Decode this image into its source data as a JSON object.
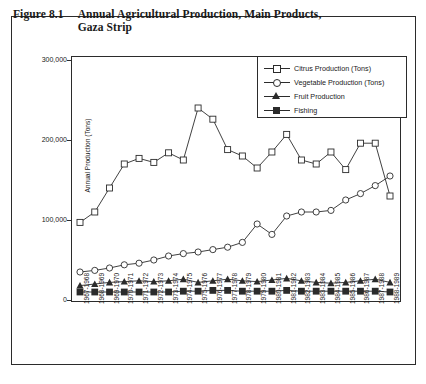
{
  "figure": {
    "number": "Figure 8.1",
    "title": "Annual Agricultural Production, Main Products, Gaza Strip"
  },
  "colors": {
    "ink": "#2b2b2b",
    "background": "#ffffff"
  },
  "chart_data": {
    "type": "line",
    "title": "Annual Agricultural Production, Main Products, Gaza Strip",
    "xlabel": "",
    "ylabel": "Annual Production (Tons)",
    "ylim": [
      0,
      300000
    ],
    "yticks": [
      0,
      100000,
      200000,
      300000
    ],
    "ytick_labels": [
      "0",
      "100,000",
      "200,000",
      "300,000"
    ],
    "grid": false,
    "legend_position": "top-right",
    "categories": [
      "1967-1968",
      "1968-1969",
      "1969-1970",
      "1970-1971",
      "1971-1972",
      "1972-1973",
      "1973-1974",
      "1974-1975",
      "1975-1976",
      "1976-1977",
      "1977-1978",
      "1978-1979",
      "1979-1980",
      "1980-1981",
      "1981-1982",
      "1982-1983",
      "1983-1984",
      "1984-1985",
      "1985-1986",
      "1986-1987",
      "1987-1988",
      "1988-1989"
    ],
    "series": [
      {
        "name": "Citrus Production (Tons)",
        "marker": "square-open",
        "values": [
          97000,
          110000,
          140000,
          170000,
          177000,
          172000,
          184000,
          175000,
          240000,
          226000,
          188000,
          180000,
          165000,
          185000,
          207000,
          175000,
          170000,
          185000,
          163000,
          196000,
          196000,
          130000
        ]
      },
      {
        "name": "Vegetable Production (Tons)",
        "marker": "circle-open",
        "values": [
          35000,
          37000,
          40000,
          44000,
          46000,
          50000,
          55000,
          58000,
          60000,
          63000,
          66000,
          72000,
          95000,
          82000,
          105000,
          110000,
          110000,
          112000,
          125000,
          133000,
          143000,
          155000
        ]
      },
      {
        "name": "Fruit Production",
        "marker": "triangle-filled",
        "values": [
          18000,
          20000,
          22000,
          23000,
          24000,
          23000,
          24000,
          26000,
          22000,
          24000,
          26000,
          24000,
          23000,
          25000,
          27000,
          24000,
          22000,
          21000,
          22000,
          24000,
          26000,
          22000
        ]
      },
      {
        "name": "Fishing",
        "marker": "square-filled",
        "values": [
          10000,
          10000,
          10000,
          10000,
          10000,
          10000,
          10000,
          11000,
          11000,
          12000,
          12000,
          11000,
          11000,
          11000,
          12000,
          11000,
          11000,
          11000,
          11000,
          11000,
          11000,
          10000
        ]
      }
    ]
  }
}
